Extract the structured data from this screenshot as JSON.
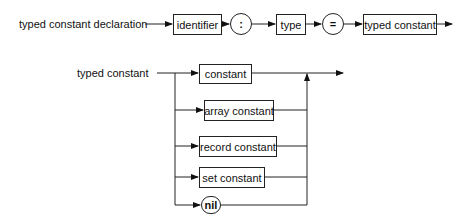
{
  "diagram": {
    "type": "syntax-diagram",
    "rule1": {
      "name": "typed constant declaration",
      "sequence": [
        {
          "kind": "nonterminal",
          "label": "identifier"
        },
        {
          "kind": "terminal",
          "label": ":"
        },
        {
          "kind": "nonterminal",
          "label": "type"
        },
        {
          "kind": "terminal",
          "label": "="
        },
        {
          "kind": "nonterminal",
          "label": "typed constant"
        }
      ]
    },
    "rule2": {
      "name": "typed constant",
      "alternatives": [
        {
          "kind": "nonterminal",
          "label": "constant"
        },
        {
          "kind": "nonterminal",
          "label": "array constant"
        },
        {
          "kind": "nonterminal",
          "label": "record constant"
        },
        {
          "kind": "nonterminal",
          "label": "set constant"
        },
        {
          "kind": "terminal",
          "label": "nil"
        }
      ]
    }
  }
}
